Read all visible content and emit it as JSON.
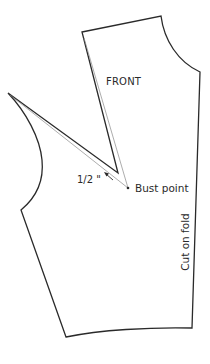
{
  "diagram": {
    "labels": {
      "front": "FRONT",
      "bust_point": "Bust point",
      "measurement": "1/2 \"",
      "fold": "Cut on fold"
    },
    "colors": {
      "outline": "#2a2a2a",
      "guide_line": "#8a8a8a",
      "background": "#ffffff"
    },
    "points": {
      "shoulder_neck": [
        161,
        16
      ],
      "shoulder_armhole": [
        82,
        32
      ],
      "center_front_neck": [
        200,
        72
      ],
      "center_front_waist": [
        192,
        328
      ],
      "side_waist": [
        66,
        337
      ],
      "underarm": [
        21,
        210
      ],
      "shoulder_point_left": [
        8,
        93
      ],
      "dart_apex": [
        118,
        173
      ],
      "bust_point": [
        128,
        188
      ]
    }
  }
}
